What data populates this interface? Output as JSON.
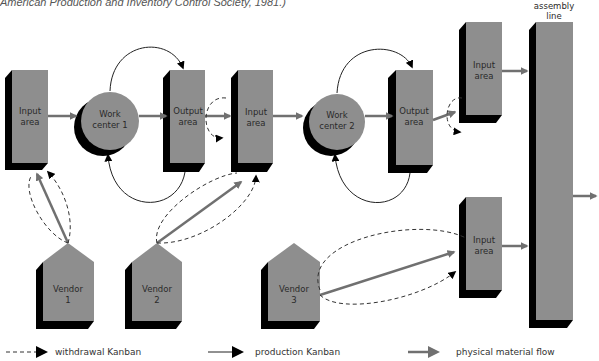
{
  "caption": "American Production and Inventory Control Society, 1981.)",
  "colors": {
    "box_fill": "#8e8e8e",
    "shadow": "#000000",
    "flow_arrow": "#707070",
    "kanban_line": "#333333",
    "background": "#ffffff"
  },
  "nodes": {
    "input_area_1": {
      "line1": "Input",
      "line2": "area"
    },
    "work_center_1": {
      "line1": "Work",
      "line2": "center 1"
    },
    "output_area_1": {
      "line1": "Output",
      "line2": "area"
    },
    "input_area_2": {
      "line1": "Input",
      "line2": "area"
    },
    "work_center_2": {
      "line1": "Work",
      "line2": "center 2"
    },
    "output_area_2": {
      "line1": "Output",
      "line2": "area"
    },
    "input_area_3": {
      "line1": "Input",
      "line2": "area"
    },
    "input_area_4": {
      "line1": "Input",
      "line2": "area"
    },
    "assembly_line": {
      "line1": "assembly",
      "line2": "line"
    },
    "vendor_1": {
      "line1": "Vendor",
      "line2": "1"
    },
    "vendor_2": {
      "line1": "Vendor",
      "line2": "2"
    },
    "vendor_3": {
      "line1": "Vendor",
      "line2": "3"
    }
  },
  "legend": {
    "withdrawal": "withdrawal Kanban",
    "production": "production Kanban",
    "physical": "physical material flow"
  }
}
